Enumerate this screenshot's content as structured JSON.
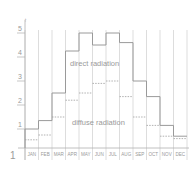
{
  "figure_number": "1",
  "colors": {
    "background": "#ffffff",
    "grid": "#d4d4d4",
    "axis": "#b0b0b0",
    "direct_line": "#9a9a9a",
    "diffuse_line": "#a8a8a8",
    "text": "#9a9a9a"
  },
  "labels": {
    "direct": "direct radiation",
    "diffuse": "diffuse radiation"
  },
  "chart_data": {
    "type": "line",
    "subtype": "step",
    "title": "",
    "xlabel": "",
    "ylabel": "",
    "ylim": [
      0,
      5.2
    ],
    "yticks": [
      1,
      2,
      3,
      4,
      5
    ],
    "grid": true,
    "legend_position": "inline annotations",
    "categories": [
      "JAN",
      "FEB",
      "MAR",
      "APR",
      "MAY",
      "JUN",
      "JUL",
      "AUG",
      "SEP",
      "OCT",
      "NOV",
      "DEC"
    ],
    "series": [
      {
        "name": "direct radiation",
        "style": "solid",
        "values": [
          1.0,
          1.35,
          2.5,
          4.25,
          5.0,
          4.5,
          5.0,
          4.6,
          3.0,
          2.35,
          1.15,
          0.7
        ]
      },
      {
        "name": "diffuse radiation",
        "style": "dashed",
        "values": [
          0.55,
          0.75,
          1.5,
          2.2,
          2.5,
          2.9,
          3.0,
          2.35,
          1.5,
          1.15,
          0.7,
          0.6
        ]
      }
    ],
    "annotations": [
      {
        "text": "direct radiation",
        "x_month": "MAY",
        "y": 3.75
      },
      {
        "text": "diffuse radiation",
        "x_month": "MAY",
        "y": 1.3
      }
    ]
  }
}
